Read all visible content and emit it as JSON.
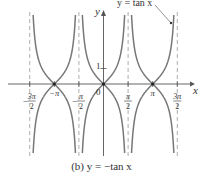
{
  "figure": {
    "caption": "(b) y = −tan x",
    "annotation": "y = tan x",
    "axis_labels": {
      "x": "x",
      "y": "y"
    },
    "origin_label": "0",
    "y_tick_label": "1",
    "x_tick_labels": [
      "−3π/2",
      "−π",
      "−π/2",
      "π/2",
      "π",
      "3π/2"
    ]
  },
  "colors": {
    "curve": "#777777",
    "axis": "#555555",
    "asymptote": "#999999",
    "text": "#333333"
  },
  "chart_data": {
    "type": "line",
    "title": "(b) y = −tan x",
    "xlabel": "x",
    "ylabel": "y",
    "xlim": [
      -4.9,
      5.3
    ],
    "ylim": [
      -4.5,
      4.5
    ],
    "grid": false,
    "x_ticks": [
      {
        "value": -4.712,
        "label": "−3π/2"
      },
      {
        "value": -3.1416,
        "label": "−π"
      },
      {
        "value": -1.5708,
        "label": "−π/2"
      },
      {
        "value": 1.5708,
        "label": "π/2"
      },
      {
        "value": 3.1416,
        "label": "π"
      },
      {
        "value": 4.712,
        "label": "3π/2"
      }
    ],
    "y_ticks": [
      {
        "value": 1,
        "label": "1"
      }
    ],
    "vertical_asymptotes": [
      -4.712,
      -1.5708,
      1.5708,
      4.712
    ],
    "series": [
      {
        "name": "y = −tan x",
        "function": "-tan(x)",
        "style": "solid"
      },
      {
        "name": "y = tan x",
        "function": "tan(x)",
        "style": "solid",
        "annotated": true
      }
    ],
    "marked_points": [
      {
        "x": -3.1416,
        "y": 0
      },
      {
        "x": 0,
        "y": 0
      },
      {
        "x": 3.1416,
        "y": 0
      }
    ],
    "annotations": [
      {
        "text": "y = tan x",
        "points_to_series": "y = tan x",
        "position": "top-right"
      }
    ]
  }
}
